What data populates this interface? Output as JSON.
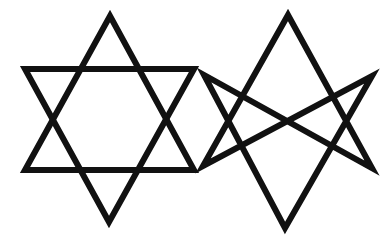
{
  "figure": {
    "background": "#ffffff",
    "stroke_color": "#111111",
    "stroke_width": 6,
    "symbols": [
      {
        "name": "hexagram",
        "label": "Hexagram (Star of David)",
        "triangles": [
          "110,16 194,170 25,170",
          "25,69 194,69 109,222"
        ]
      },
      {
        "name": "unicursal-hexagram",
        "label": "Unicursal hexagram",
        "path": "M288,15 L372,168 L204,75 L285,228 L372,76 L203,166 Z"
      }
    ]
  }
}
